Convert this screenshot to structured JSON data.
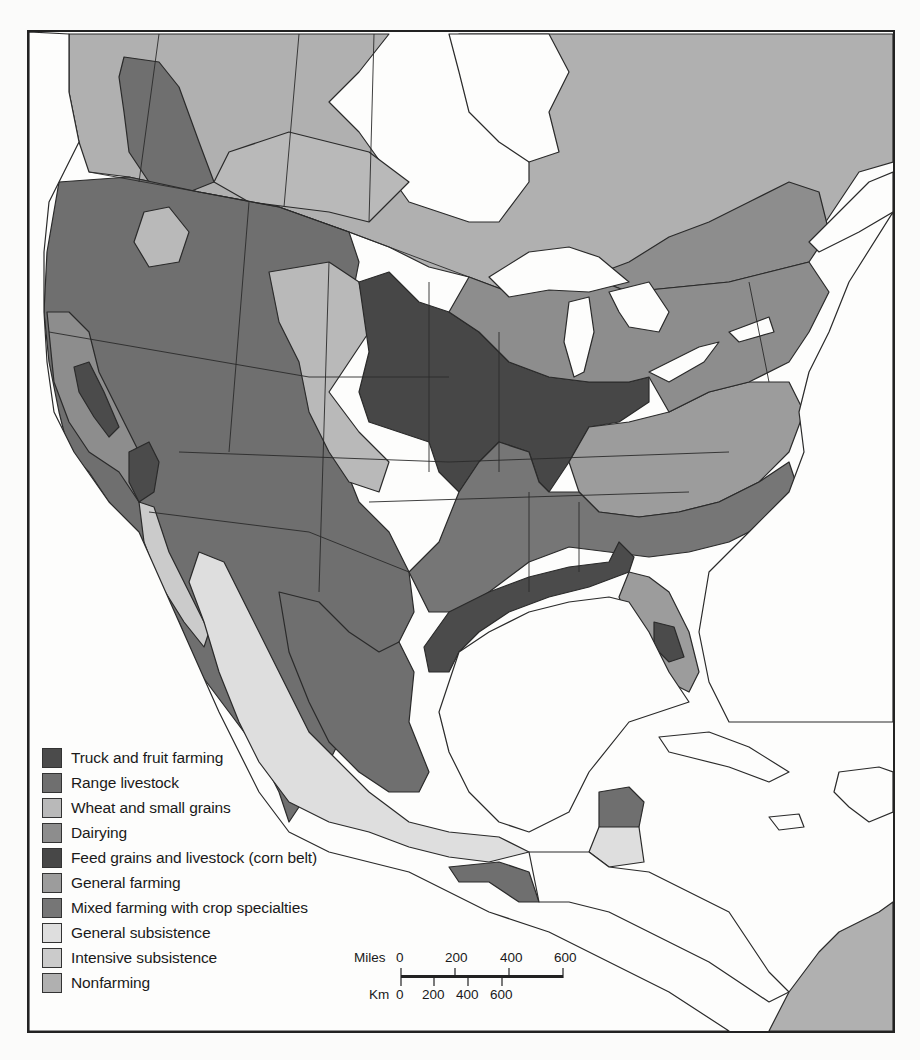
{
  "legend": {
    "items": [
      {
        "label": "Truck and fruit farming",
        "color": "#4b4b4b"
      },
      {
        "label": "Range livestock",
        "color": "#6f6f6f"
      },
      {
        "label": "Wheat and small grains",
        "color": "#b9b9b9"
      },
      {
        "label": "Dairying",
        "color": "#8d8d8d"
      },
      {
        "label": "Feed grains and livestock (corn belt)",
        "color": "#474747"
      },
      {
        "label": "General farming",
        "color": "#9c9c9c"
      },
      {
        "label": "Mixed farming with crop specialties",
        "color": "#767676"
      },
      {
        "label": "General subsistence",
        "color": "#dedede"
      },
      {
        "label": "Intensive subsistence",
        "color": "#cbcbcb"
      },
      {
        "label": "Nonfarming",
        "color": "#b0b0b0"
      }
    ]
  },
  "scale_bar": {
    "miles_label": "Miles",
    "miles_ticks": [
      "0",
      "200",
      "400",
      "600"
    ],
    "km_label": "Km",
    "km_ticks": [
      "0",
      "200",
      "400",
      "600"
    ]
  },
  "colors": {
    "water": "#fdfdfc",
    "border": "#222222"
  }
}
